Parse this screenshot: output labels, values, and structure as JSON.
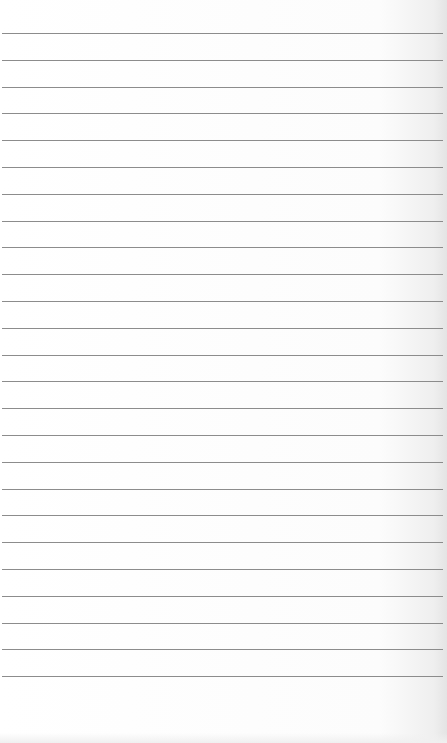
{
  "page": {
    "type": "lined-paper",
    "background_color": "#fdfdfd",
    "rule_color": "#8c8c8c",
    "rule_count": 25,
    "first_rule_y": 33,
    "rule_spacing": 26.8,
    "bleed_through_text": ""
  }
}
